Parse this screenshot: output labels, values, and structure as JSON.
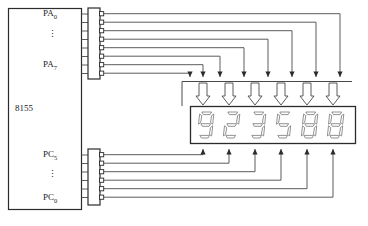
{
  "diagram": {
    "chip": {
      "name": "8155",
      "port_a": {
        "top_label": "PA",
        "top_sub": "0",
        "bottom_label": "PA",
        "bottom_sub": "7",
        "ellipsis": "⋮",
        "line_count": 8
      },
      "port_c": {
        "top_label": "PC",
        "top_sub": "5",
        "bottom_label": "PC",
        "bottom_sub": "0",
        "ellipsis": "⋮",
        "line_count": 6
      }
    },
    "buffers": {
      "segment_driver_count": 8,
      "digit_driver_count": 6
    },
    "display": {
      "digit_count": 6,
      "digits": [
        "9",
        "2",
        "3",
        "5",
        "8",
        "8"
      ],
      "segments": {
        "9": [
          "a",
          "b",
          "c",
          "d",
          "f",
          "g"
        ],
        "2": [
          "a",
          "b",
          "d",
          "e",
          "g"
        ],
        "3": [
          "a",
          "b",
          "c",
          "d",
          "g"
        ],
        "5": [
          "a",
          "c",
          "d",
          "f",
          "g"
        ],
        "8": [
          "a",
          "b",
          "c",
          "d",
          "e",
          "f",
          "g"
        ]
      }
    },
    "colors": {
      "line": "#4a4a4a",
      "outline": "#2b2b2b",
      "segment_stroke": "#6e6e6e",
      "text": "#1a1a1a",
      "background": "#ffffff"
    }
  }
}
